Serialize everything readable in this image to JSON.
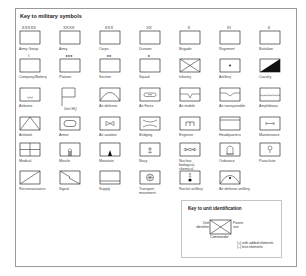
{
  "title": "Key to military symbols",
  "symbols": [
    {
      "label": "Army Group",
      "mark": "XXXXX"
    },
    {
      "label": "Army",
      "mark": "XXXX"
    },
    {
      "label": "Corps",
      "mark": "XXX"
    },
    {
      "label": "Division",
      "mark": "XX"
    },
    {
      "label": "Brigade",
      "mark": "X"
    },
    {
      "label": "Regiment",
      "mark": "III"
    },
    {
      "label": "Battalion",
      "mark": "II"
    },
    {
      "label": "Company/Battery",
      "mark": "I"
    },
    {
      "label": "Platoon",
      "mark": "●●●"
    },
    {
      "label": "Section",
      "mark": "●●"
    },
    {
      "label": "Squad",
      "mark": "●"
    },
    {
      "label": "Infantry",
      "mark": ""
    },
    {
      "label": "Artillery",
      "mark": ""
    },
    {
      "label": "Cavalry",
      "mark": ""
    },
    {
      "label": "Airborne",
      "mark": ""
    },
    {
      "label": "Unit HQ",
      "mark": ""
    },
    {
      "label": "Air defense",
      "mark": ""
    },
    {
      "label": "Air Force",
      "mark": ""
    },
    {
      "label": "Air mobile",
      "mark": ""
    },
    {
      "label": "Air transportable",
      "mark": ""
    },
    {
      "label": "Amphibious",
      "mark": ""
    },
    {
      "label": "Antitank",
      "mark": ""
    },
    {
      "label": "Armor",
      "mark": ""
    },
    {
      "label": "Air aviation",
      "mark": ""
    },
    {
      "label": "Bridging",
      "mark": ""
    },
    {
      "label": "Engineer",
      "mark": ""
    },
    {
      "label": "Headquarters",
      "mark": ""
    },
    {
      "label": "Maintenance",
      "mark": ""
    },
    {
      "label": "Medical",
      "mark": ""
    },
    {
      "label": "Missile",
      "mark": ""
    },
    {
      "label": "Mountain",
      "mark": ""
    },
    {
      "label": "Navy",
      "mark": ""
    },
    {
      "label": "Nuclear, biological, chemical",
      "mark": ""
    },
    {
      "label": "Ordnance",
      "mark": ""
    },
    {
      "label": "Parachute",
      "mark": ""
    },
    {
      "label": "Reconnaissance",
      "mark": ""
    },
    {
      "label": "Signal",
      "mark": ""
    },
    {
      "label": "Supply",
      "mark": ""
    },
    {
      "label": "Transport movement",
      "mark": ""
    },
    {
      "label": "Rocket artillery",
      "mark": ""
    },
    {
      "label": "Air defense artillery",
      "mark": ""
    }
  ],
  "key_unit": {
    "title": "Key to unit identification",
    "left_label_1": "Unit",
    "left_label_2": "identifier",
    "right_label_1": "Parent",
    "right_label_2": "unit",
    "bottom_label": "Commander",
    "note_1": "(+) with added elements",
    "note_2": "(–) less elements"
  }
}
